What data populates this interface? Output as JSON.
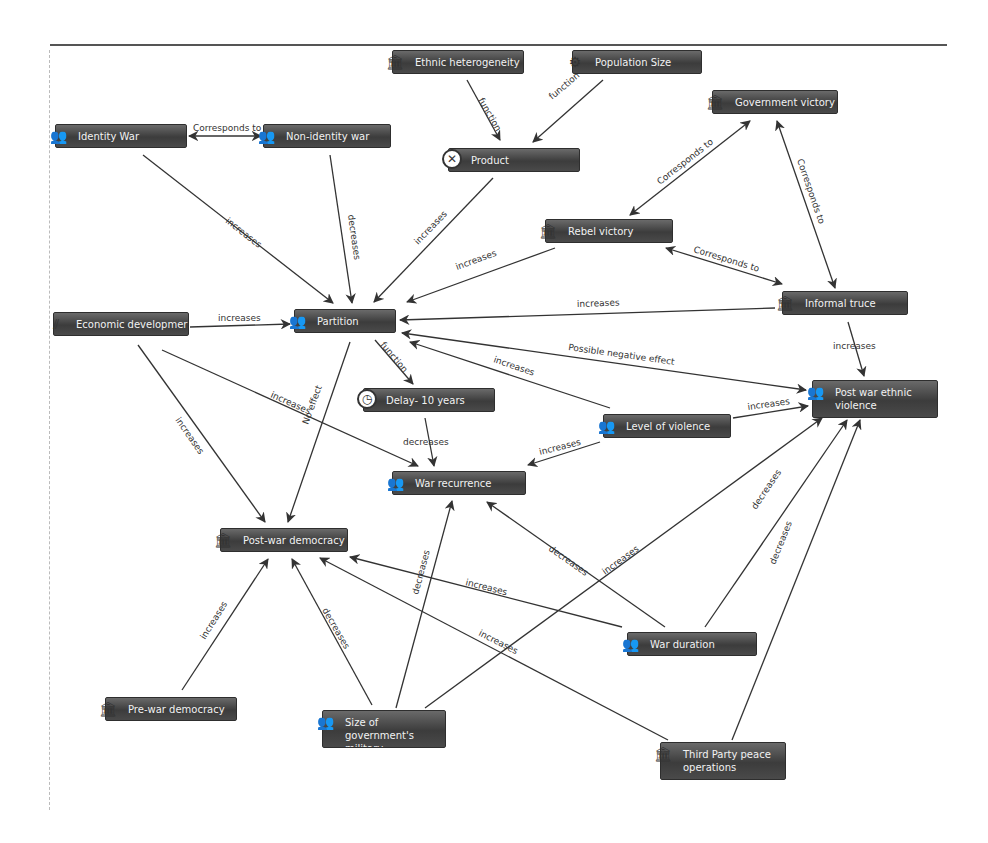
{
  "diagram": {
    "type": "causal-concept-map",
    "nodes": [
      {
        "id": "ethnic_heterogeneity",
        "label": "Ethnic heterogeneity",
        "icon": "building-icon",
        "x": 392,
        "y": 50,
        "w": 132
      },
      {
        "id": "population_size",
        "label": "Population Size",
        "icon": "gear-icon",
        "x": 572,
        "y": 50,
        "w": 130
      },
      {
        "id": "government_victory",
        "label": "Government victory",
        "icon": "building-icon",
        "x": 712,
        "y": 90,
        "w": 126
      },
      {
        "id": "identity_war",
        "label": "Identity War",
        "icon": "people-icon",
        "x": 55,
        "y": 124,
        "w": 132
      },
      {
        "id": "non_identity_war",
        "label": "Non-identity war",
        "icon": "people-icon",
        "x": 263,
        "y": 124,
        "w": 128
      },
      {
        "id": "product",
        "label": "Product",
        "icon": "multiply-circle-icon",
        "x": 448,
        "y": 148,
        "w": 132
      },
      {
        "id": "rebel_victory",
        "label": "Rebel victory",
        "icon": "building-icon",
        "x": 545,
        "y": 219,
        "w": 128
      },
      {
        "id": "informal_truce",
        "label": "Informal truce",
        "icon": "building-icon",
        "x": 782,
        "y": 291,
        "w": 126
      },
      {
        "id": "economic_development",
        "label": "Economic developmer",
        "icon": "stairs-icon",
        "x": 53,
        "y": 312,
        "w": 136
      },
      {
        "id": "partition",
        "label": "Partition",
        "icon": "people-icon",
        "x": 294,
        "y": 309,
        "w": 102
      },
      {
        "id": "post_war_ethnic_violence",
        "label": "Post war ethnic violence",
        "icon": "people-icon",
        "x": 812,
        "y": 380,
        "w": 126,
        "tall": true
      },
      {
        "id": "delay_10_years",
        "label": "Delay- 10 years",
        "icon": "clock-icon",
        "x": 363,
        "y": 388,
        "w": 132
      },
      {
        "id": "level_of_violence",
        "label": "Level of violence",
        "icon": "people-icon",
        "x": 603,
        "y": 414,
        "w": 128
      },
      {
        "id": "war_recurrence",
        "label": "War recurrence",
        "icon": "people-icon",
        "x": 392,
        "y": 471,
        "w": 134
      },
      {
        "id": "post_war_democracy",
        "label": "Post-war democracy",
        "icon": "building-icon",
        "x": 220,
        "y": 528,
        "w": 128
      },
      {
        "id": "war_duration",
        "label": "War duration",
        "icon": "people-icon",
        "x": 627,
        "y": 632,
        "w": 130
      },
      {
        "id": "pre_war_democracy",
        "label": "Pre-war democracy",
        "icon": "building-icon",
        "x": 105,
        "y": 697,
        "w": 132
      },
      {
        "id": "size_of_governments_military",
        "label": "Size of government's military",
        "icon": "people-icon",
        "x": 322,
        "y": 710,
        "w": 124,
        "tall": true
      },
      {
        "id": "third_party_peace_operations",
        "label": "Third Party peace operations",
        "icon": "building-icon",
        "x": 660,
        "y": 742,
        "w": 126,
        "tall": true
      }
    ],
    "edges": [
      {
        "from": "ethnic_heterogeneity",
        "to": "product",
        "label": "function",
        "x1": 467,
        "y1": 80,
        "x2": 500,
        "y2": 140,
        "lx": 478,
        "ly": 100,
        "rot": 60
      },
      {
        "from": "population_size",
        "to": "product",
        "label": "function",
        "x1": 603,
        "y1": 80,
        "x2": 533,
        "y2": 142,
        "lx": 552,
        "ly": 100,
        "rot": -40
      },
      {
        "from": "identity_war",
        "to": "non_identity_war",
        "label": "Corresponds to",
        "x1": 189,
        "y1": 136,
        "x2": 261,
        "y2": 136,
        "lx": 193,
        "ly": 131,
        "rot": 0,
        "both": true
      },
      {
        "from": "identity_war",
        "to": "partition",
        "label": "increases",
        "x1": 143,
        "y1": 155,
        "x2": 333,
        "y2": 303,
        "lx": 225,
        "ly": 222,
        "rot": 38
      },
      {
        "from": "non_identity_war",
        "to": "partition",
        "label": "decreases",
        "x1": 330,
        "y1": 155,
        "x2": 352,
        "y2": 303,
        "lx": 348,
        "ly": 215,
        "rot": 82
      },
      {
        "from": "product",
        "to": "partition",
        "label": "increases",
        "x1": 493,
        "y1": 178,
        "x2": 374,
        "y2": 302,
        "lx": 418,
        "ly": 245,
        "rot": -46
      },
      {
        "from": "rebel_victory",
        "to": "government_victory",
        "label": "Corresponds to",
        "x1": 630,
        "y1": 215,
        "x2": 750,
        "y2": 121,
        "lx": 660,
        "ly": 185,
        "rot": -38,
        "both": true
      },
      {
        "from": "government_victory",
        "to": "informal_truce",
        "label": "Corresponds to",
        "x1": 777,
        "y1": 121,
        "x2": 835,
        "y2": 288,
        "lx": 797,
        "ly": 160,
        "rot": 71,
        "both": true
      },
      {
        "from": "rebel_victory",
        "to": "informal_truce",
        "label": "Corresponds to",
        "x1": 666,
        "y1": 248,
        "x2": 782,
        "y2": 284,
        "lx": 693,
        "ly": 252,
        "rot": 17,
        "both": true
      },
      {
        "from": "rebel_victory",
        "to": "partition",
        "label": "increases",
        "x1": 555,
        "y1": 248,
        "x2": 407,
        "y2": 302,
        "lx": 457,
        "ly": 270,
        "rot": -20
      },
      {
        "from": "informal_truce",
        "to": "partition",
        "label": "increases",
        "x1": 775,
        "y1": 308,
        "x2": 400,
        "y2": 320,
        "lx": 577,
        "ly": 307,
        "rot": -2
      },
      {
        "from": "economic_development",
        "to": "partition",
        "label": "increases",
        "x1": 190,
        "y1": 327,
        "x2": 290,
        "y2": 324,
        "lx": 218,
        "ly": 321,
        "rot": 0
      },
      {
        "from": "partition",
        "to": "post_war_ethnic_violence",
        "label": "Possible negative effect",
        "x1": 402,
        "y1": 333,
        "x2": 806,
        "y2": 390,
        "lx": 568,
        "ly": 350,
        "rot": 8,
        "both": true
      },
      {
        "from": "level_of_violence",
        "to": "partition",
        "label": "increases",
        "x1": 610,
        "y1": 408,
        "x2": 410,
        "y2": 342,
        "lx": 493,
        "ly": 362,
        "rot": 19
      },
      {
        "from": "informal_truce",
        "to": "post_war_ethnic_violence",
        "label": "increases",
        "x1": 848,
        "y1": 322,
        "x2": 864,
        "y2": 376,
        "lx": 833,
        "ly": 349,
        "rot": 0
      },
      {
        "from": "partition",
        "to": "delay_10_years",
        "label": "function",
        "x1": 375,
        "y1": 340,
        "x2": 413,
        "y2": 384,
        "lx": 380,
        "ly": 345,
        "rot": 50
      },
      {
        "from": "level_of_violence",
        "to": "post_war_ethnic_violence",
        "label": "increases",
        "x1": 733,
        "y1": 418,
        "x2": 808,
        "y2": 406,
        "lx": 748,
        "ly": 410,
        "rot": -8
      },
      {
        "from": "delay_10_years",
        "to": "war_recurrence",
        "label": "decreases",
        "x1": 425,
        "y1": 418,
        "x2": 434,
        "y2": 466,
        "lx": 403,
        "ly": 445,
        "rot": 0
      },
      {
        "from": "level_of_violence",
        "to": "war_recurrence",
        "label": "increases",
        "x1": 600,
        "y1": 442,
        "x2": 528,
        "y2": 465,
        "lx": 540,
        "ly": 455,
        "rot": -14
      },
      {
        "from": "economic_development",
        "to": "war_recurrence",
        "label": "increases",
        "x1": 162,
        "y1": 350,
        "x2": 418,
        "y2": 466,
        "lx": 270,
        "ly": 397,
        "rot": 24
      },
      {
        "from": "economic_development",
        "to": "post_war_democracy",
        "label": "increases",
        "x1": 138,
        "y1": 345,
        "x2": 265,
        "y2": 522,
        "lx": 175,
        "ly": 420,
        "rot": 55
      },
      {
        "from": "partition",
        "to": "post_war_democracy",
        "label": "No effect",
        "x1": 350,
        "y1": 342,
        "x2": 288,
        "y2": 522,
        "lx": 308,
        "ly": 425,
        "rot": -70
      },
      {
        "from": "size_of_governments_military",
        "to": "war_recurrence",
        "label": "decreases",
        "x1": 396,
        "y1": 708,
        "x2": 452,
        "y2": 501,
        "lx": 418,
        "ly": 595,
        "rot": -75
      },
      {
        "from": "war_duration",
        "to": "war_recurrence",
        "label": "decreases",
        "x1": 665,
        "y1": 627,
        "x2": 487,
        "y2": 502,
        "lx": 548,
        "ly": 550,
        "rot": 35
      },
      {
        "from": "war_duration",
        "to": "post_war_democracy",
        "label": "increases",
        "x1": 622,
        "y1": 627,
        "x2": 350,
        "y2": 557,
        "lx": 465,
        "ly": 585,
        "rot": 14
      },
      {
        "from": "size_of_governments_military",
        "to": "post_war_ethnic_violence",
        "label": "increases",
        "x1": 425,
        "y1": 708,
        "x2": 822,
        "y2": 418,
        "lx": 605,
        "ly": 575,
        "rot": -36
      },
      {
        "from": "war_duration",
        "to": "post_war_ethnic_violence",
        "label": "decreases",
        "x1": 705,
        "y1": 627,
        "x2": 847,
        "y2": 420,
        "lx": 756,
        "ly": 510,
        "rot": -56
      },
      {
        "from": "third_party_peace_operations",
        "to": "post_war_ethnic_violence",
        "label": "decreases",
        "x1": 732,
        "y1": 740,
        "x2": 860,
        "y2": 420,
        "lx": 775,
        "ly": 565,
        "rot": -68
      },
      {
        "from": "third_party_peace_operations",
        "to": "post_war_democracy",
        "label": "increases",
        "x1": 668,
        "y1": 740,
        "x2": 320,
        "y2": 558,
        "lx": 478,
        "ly": 635,
        "rot": 27
      },
      {
        "from": "size_of_governments_military",
        "to": "post_war_democracy",
        "label": "decreases",
        "x1": 372,
        "y1": 705,
        "x2": 292,
        "y2": 559,
        "lx": 322,
        "ly": 610,
        "rot": 60
      },
      {
        "from": "pre_war_democracy",
        "to": "post_war_democracy",
        "label": "increases",
        "x1": 182,
        "y1": 690,
        "x2": 268,
        "y2": 559,
        "lx": 205,
        "ly": 640,
        "rot": -58
      }
    ]
  }
}
